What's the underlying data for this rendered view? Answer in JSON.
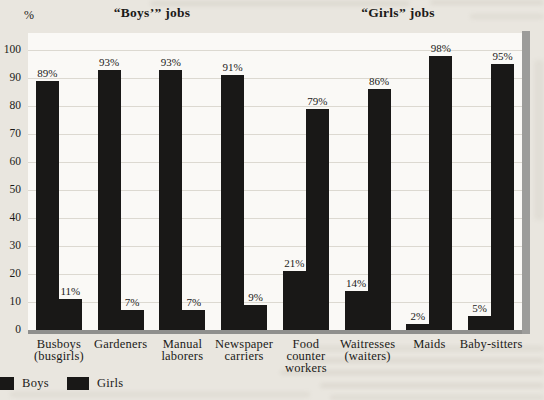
{
  "chart_data": {
    "type": "bar",
    "title": "",
    "group_titles": [
      "“Boys’” jobs",
      "“Girls” jobs"
    ],
    "ylabel": "%",
    "ylim": [
      0,
      100
    ],
    "yticks": [
      0,
      10,
      20,
      30,
      40,
      50,
      60,
      70,
      80,
      90,
      100
    ],
    "grid": true,
    "legend_position": "bottom-left",
    "bar_color": "#191817",
    "categories": [
      "Busboys (busgirls)",
      "Gardeners",
      "Manual laborers",
      "Newspaper carriers",
      "Food counter workers",
      "Waitresses (waiters)",
      "Maids",
      "Baby-sitters"
    ],
    "category_lines": [
      [
        "Busboys",
        "(busgirls)"
      ],
      [
        "Gardeners"
      ],
      [
        "Manual",
        "laborers"
      ],
      [
        "Newspaper",
        "carriers"
      ],
      [
        "Food",
        "counter",
        "workers"
      ],
      [
        "Waitresses",
        "(waiters)"
      ],
      [
        "Maids"
      ],
      [
        "Baby-sitters"
      ]
    ],
    "series": [
      {
        "name": "Boys",
        "values": [
          89,
          93,
          93,
          91,
          21,
          14,
          2,
          5
        ]
      },
      {
        "name": "Girls",
        "values": [
          11,
          7,
          7,
          9,
          79,
          86,
          98,
          95
        ]
      }
    ],
    "value_label_suffix": "%",
    "legend": [
      "Boys",
      "Girls"
    ]
  }
}
